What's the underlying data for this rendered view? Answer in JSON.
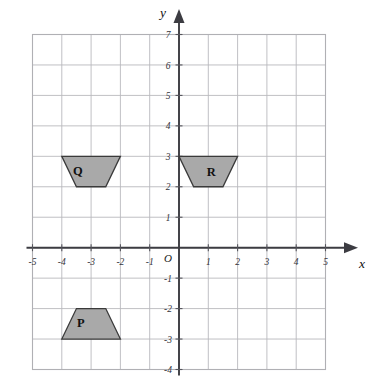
{
  "figure": {
    "background_color": "#ffffff",
    "grid_color": "#b9b9bd",
    "axis_color": "#3c3c42",
    "shape_fill": "#a9a9a9",
    "shape_stroke": "#3a3a3a"
  },
  "axes": {
    "x_label": "x",
    "y_label": "y",
    "origin_label": "O",
    "x_range": [
      -5,
      5
    ],
    "y_range": [
      -4,
      7
    ],
    "x_ticks": [
      "-5",
      "-4",
      "-3",
      "-2",
      "-1",
      "1",
      "2",
      "3",
      "4",
      "5"
    ],
    "y_ticks": [
      "7",
      "6",
      "5",
      "4",
      "3",
      "2",
      "1",
      "-1",
      "-2",
      "-3",
      "-4"
    ],
    "grid": "on",
    "grid_step": 1
  },
  "shapes": [
    {
      "label": "P",
      "label_x": -3.35,
      "label_y": -2.45,
      "orientation": "upright-trapezoid",
      "vertices": [
        [
          -4,
          -3
        ],
        [
          -2,
          -3
        ],
        [
          -2.5,
          -2
        ],
        [
          -3.5,
          -2
        ]
      ]
    },
    {
      "label": "Q",
      "label_x": -3.45,
      "label_y": 2.55,
      "orientation": "inverted-trapezoid",
      "vertices": [
        [
          -4,
          3
        ],
        [
          -2,
          3
        ],
        [
          -2.5,
          2
        ],
        [
          -3.5,
          2
        ]
      ]
    },
    {
      "label": "R",
      "label_x": 1.1,
      "label_y": 2.5,
      "orientation": "inverted-trapezoid",
      "vertices": [
        [
          0,
          3
        ],
        [
          2,
          3
        ],
        [
          1.5,
          2
        ],
        [
          0.5,
          2
        ]
      ]
    }
  ],
  "chart_data": {
    "type": "scatter",
    "xlabel": "x",
    "ylabel": "y",
    "xlim": [
      -5,
      5
    ],
    "ylim": [
      -4,
      7
    ],
    "grid": true,
    "annotations": [
      "P",
      "Q",
      "R"
    ]
  }
}
